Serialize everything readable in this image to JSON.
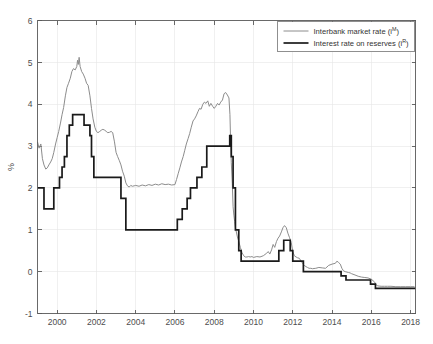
{
  "chart_data": {
    "type": "line",
    "title": "",
    "xlabel": "",
    "ylabel": "%",
    "xlim": [
      1999.0,
      2018.25
    ],
    "ylim": [
      -1,
      6
    ],
    "xticks": [
      2000,
      2002,
      2004,
      2006,
      2008,
      2010,
      2012,
      2014,
      2016,
      2018
    ],
    "xtick_labels": [
      "2000",
      "2002",
      "2004",
      "2006",
      "2008",
      "2010",
      "2012",
      "2014",
      "2016",
      "2018"
    ],
    "yticks": [
      -1,
      0,
      1,
      2,
      3,
      4,
      5,
      6
    ],
    "ytick_labels": [
      "-1",
      "0",
      "1",
      "2",
      "3",
      "4",
      "5",
      "6"
    ],
    "grid": true,
    "legend_position": "top-right",
    "colors": {
      "market": "#8c8c8c",
      "reserves": "#1a1a1a",
      "grid": "#e6e6e6",
      "axis": "#595959",
      "background": "#ffffff"
    },
    "series": [
      {
        "name": "Interbank market rate (i^M)",
        "label_main": "Interbank market rate (i",
        "label_sup": "M",
        "label_tail": ")",
        "color": "#8c8c8c",
        "linewidth": 1.0,
        "step": false,
        "x": [
          1999.0,
          1999.08,
          1999.17,
          1999.25,
          1999.33,
          1999.42,
          1999.5,
          1999.58,
          1999.67,
          1999.75,
          1999.83,
          1999.92,
          2000.0,
          2000.08,
          2000.17,
          2000.25,
          2000.33,
          2000.42,
          2000.5,
          2000.58,
          2000.67,
          2000.75,
          2000.83,
          2000.92,
          2001.0,
          2001.04,
          2001.08,
          2001.12,
          2001.17,
          2001.25,
          2001.33,
          2001.42,
          2001.5,
          2001.58,
          2001.67,
          2001.75,
          2001.83,
          2001.92,
          2002.0,
          2002.08,
          2002.17,
          2002.25,
          2002.33,
          2002.42,
          2002.5,
          2002.58,
          2002.67,
          2002.75,
          2002.83,
          2002.92,
          2003.0,
          2003.08,
          2003.17,
          2003.25,
          2003.33,
          2003.42,
          2003.5,
          2003.58,
          2003.67,
          2003.75,
          2003.83,
          2003.92,
          2004.0,
          2004.17,
          2004.33,
          2004.5,
          2004.67,
          2004.83,
          2005.0,
          2005.17,
          2005.33,
          2005.5,
          2005.67,
          2005.83,
          2006.0,
          2006.08,
          2006.17,
          2006.25,
          2006.33,
          2006.42,
          2006.5,
          2006.58,
          2006.67,
          2006.75,
          2006.83,
          2006.92,
          2007.0,
          2007.08,
          2007.17,
          2007.25,
          2007.33,
          2007.42,
          2007.5,
          2007.58,
          2007.67,
          2007.75,
          2007.83,
          2007.92,
          2008.0,
          2008.08,
          2008.17,
          2008.25,
          2008.33,
          2008.42,
          2008.5,
          2008.58,
          2008.67,
          2008.75,
          2008.8,
          2008.83,
          2008.87,
          2008.92,
          2008.96,
          2009.0,
          2009.04,
          2009.08,
          2009.17,
          2009.25,
          2009.33,
          2009.42,
          2009.5,
          2009.58,
          2009.67,
          2009.75,
          2009.83,
          2009.92,
          2010.0,
          2010.17,
          2010.33,
          2010.5,
          2010.67,
          2010.75,
          2010.83,
          2010.92,
          2011.0,
          2011.08,
          2011.17,
          2011.25,
          2011.33,
          2011.42,
          2011.5,
          2011.58,
          2011.67,
          2011.75,
          2011.83,
          2011.92,
          2012.0,
          2012.08,
          2012.17,
          2012.25,
          2012.33,
          2012.5,
          2012.58,
          2012.67,
          2012.75,
          2012.83,
          2012.92,
          2013.0,
          2013.17,
          2013.33,
          2013.5,
          2013.67,
          2013.83,
          2014.0,
          2014.17,
          2014.25,
          2014.33,
          2014.42,
          2014.5,
          2014.58,
          2014.67,
          2014.83,
          2014.92,
          2015.0,
          2015.17,
          2015.33,
          2015.5,
          2015.67,
          2015.83,
          2016.0,
          2016.17,
          2016.25,
          2016.33,
          2016.5,
          2016.67,
          2016.83,
          2017.0,
          2017.25,
          2017.5,
          2017.75,
          2018.0,
          2018.2
        ],
        "y": [
          3.1,
          2.95,
          3.05,
          2.7,
          2.55,
          2.45,
          2.48,
          2.55,
          2.62,
          2.7,
          2.85,
          3.05,
          3.2,
          3.35,
          3.55,
          3.75,
          3.92,
          4.2,
          4.4,
          4.5,
          4.62,
          4.78,
          4.85,
          4.82,
          4.9,
          5.05,
          4.95,
          5.12,
          4.9,
          4.78,
          4.72,
          4.62,
          4.5,
          4.45,
          4.2,
          3.9,
          3.65,
          3.45,
          3.35,
          3.32,
          3.35,
          3.38,
          3.4,
          3.38,
          3.35,
          3.32,
          3.33,
          3.35,
          3.32,
          3.1,
          2.85,
          2.75,
          2.65,
          2.55,
          2.4,
          2.28,
          2.12,
          2.05,
          2.02,
          2.06,
          2.04,
          2.05,
          2.06,
          2.04,
          2.07,
          2.05,
          2.08,
          2.06,
          2.09,
          2.07,
          2.1,
          2.08,
          2.09,
          2.07,
          2.08,
          2.2,
          2.35,
          2.48,
          2.62,
          2.75,
          2.9,
          3.05,
          3.18,
          3.3,
          3.45,
          3.6,
          3.65,
          3.72,
          3.82,
          3.9,
          3.88,
          4.0,
          4.05,
          4.02,
          4.08,
          3.95,
          4.02,
          3.95,
          3.9,
          3.95,
          4.02,
          3.98,
          4.05,
          4.1,
          4.25,
          4.28,
          4.22,
          4.15,
          3.75,
          3.2,
          2.6,
          2.1,
          1.55,
          1.35,
          1.2,
          1.05,
          0.85,
          0.72,
          0.58,
          0.45,
          0.38,
          0.35,
          0.35,
          0.36,
          0.35,
          0.36,
          0.34,
          0.36,
          0.35,
          0.38,
          0.44,
          0.48,
          0.42,
          0.52,
          0.65,
          0.58,
          0.72,
          0.8,
          0.85,
          0.95,
          1.05,
          1.1,
          1.05,
          0.92,
          0.82,
          0.7,
          0.48,
          0.38,
          0.35,
          0.33,
          0.32,
          0.2,
          0.15,
          0.12,
          0.1,
          0.08,
          0.08,
          0.07,
          0.08,
          0.1,
          0.09,
          0.08,
          0.15,
          0.18,
          0.2,
          0.25,
          0.22,
          0.18,
          0.08,
          0.02,
          0.0,
          -0.02,
          -0.03,
          -0.05,
          -0.08,
          -0.11,
          -0.13,
          -0.14,
          -0.15,
          -0.18,
          -0.25,
          -0.32,
          -0.34,
          -0.35,
          -0.35,
          -0.35,
          -0.35,
          -0.36,
          -0.36,
          -0.36,
          -0.36,
          -0.36
        ]
      },
      {
        "name": "Interest rate on reserves (i^R)",
        "label_main": "Interest rate on reserves (i",
        "label_sup": "R",
        "label_tail": ")",
        "color": "#1a1a1a",
        "linewidth": 1.7,
        "step": true,
        "x": [
          1999.0,
          1999.33,
          1999.83,
          2000.12,
          2000.25,
          2000.37,
          2000.5,
          2000.62,
          2000.79,
          2001.37,
          2001.67,
          2001.75,
          2001.87,
          2002.92,
          2003.25,
          2003.5,
          2005.92,
          2006.12,
          2006.37,
          2006.62,
          2006.79,
          2007.12,
          2007.37,
          2007.62,
          2008.54,
          2008.79,
          2008.87,
          2008.96,
          2009.08,
          2009.25,
          2009.37,
          2011.29,
          2011.54,
          2011.87,
          2012.0,
          2012.37,
          2012.54,
          2013.37,
          2014.46,
          2014.71,
          2015.96,
          2016.21,
          2018.25
        ],
        "y": [
          2.0,
          1.5,
          2.0,
          2.25,
          2.5,
          2.75,
          3.25,
          3.5,
          3.75,
          3.5,
          3.25,
          2.75,
          2.25,
          2.25,
          1.75,
          1.0,
          1.0,
          1.25,
          1.5,
          1.75,
          2.0,
          2.25,
          2.5,
          3.0,
          3.0,
          3.25,
          2.75,
          2.0,
          1.0,
          0.5,
          0.25,
          0.5,
          0.75,
          0.5,
          0.25,
          0.25,
          0.0,
          0.0,
          -0.1,
          -0.2,
          -0.3,
          -0.4,
          -0.4
        ]
      }
    ]
  },
  "legend": {
    "entries": [
      {
        "main": "Interbank market rate (i",
        "sup": "M",
        "tail": ")"
      },
      {
        "main": "Interest rate on reserves (i",
        "sup": "R",
        "tail": ")"
      }
    ]
  },
  "axes": {
    "ylabel": "%"
  }
}
